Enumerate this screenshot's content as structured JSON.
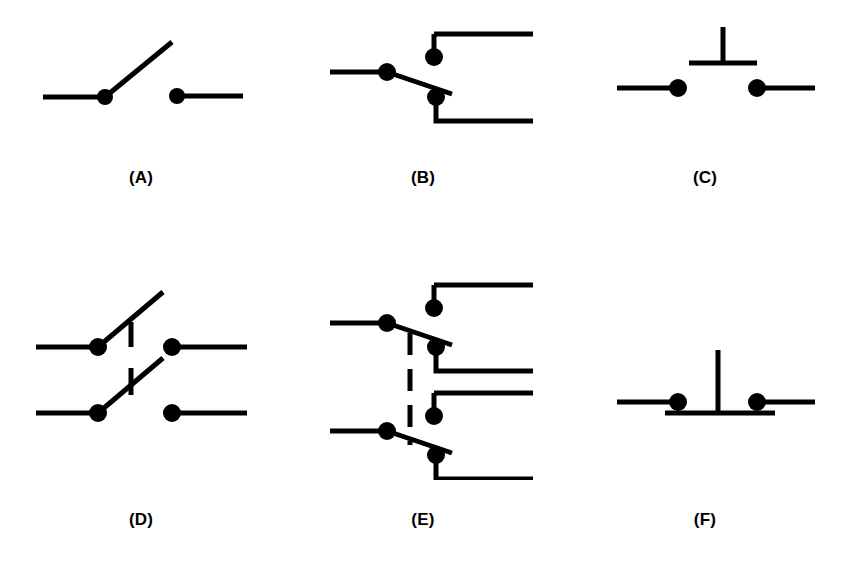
{
  "page": {
    "background_color": "#ffffff",
    "stroke_color": "#000000",
    "stroke_width": 5,
    "terminal_dot_radius": 8,
    "width": 846,
    "height": 566
  },
  "figures": [
    {
      "id": "a",
      "label": "(A)",
      "symbol_name": "spst-switch",
      "description": "Single pole single throw switch, open blade"
    },
    {
      "id": "b",
      "label": "(B)",
      "symbol_name": "spdt-switch",
      "description": "Single pole double throw switch"
    },
    {
      "id": "c",
      "label": "(C)",
      "symbol_name": "normally-open-pushbutton",
      "description": "Push button switch, normally open"
    },
    {
      "id": "d",
      "label": "(D)",
      "symbol_name": "dpst-switch",
      "description": "Double pole single throw switch with ganged linkage"
    },
    {
      "id": "e",
      "label": "(E)",
      "symbol_name": "dpdt-switch",
      "description": "Double pole double throw switch with dashed ganged linkage"
    },
    {
      "id": "f",
      "label": "(F)",
      "symbol_name": "normally-closed-pushbutton",
      "description": "Push button switch, normally closed"
    }
  ]
}
